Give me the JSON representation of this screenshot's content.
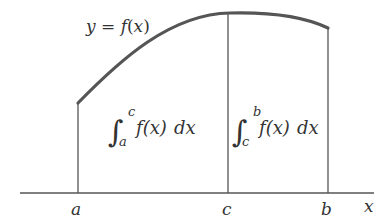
{
  "diagram": {
    "curve_label": "y = f(x)",
    "curve_label_parts": {
      "y": "y",
      "eq": " = ",
      "f": "f",
      "paren_open": "(",
      "x": "x",
      "paren_close": ")"
    },
    "axis_label": "x",
    "ticks": [
      {
        "label": "a",
        "x": 78
      },
      {
        "label": "c",
        "x": 228
      },
      {
        "label": "b",
        "x": 328
      }
    ],
    "integrals": [
      {
        "lower": "a",
        "upper": "c",
        "integrand": "f(x)",
        "differential": "dx"
      },
      {
        "lower": "c",
        "upper": "b",
        "integrand": "f(x)",
        "differential": "dx"
      }
    ],
    "colors": {
      "curve": "#555555",
      "lines": "#555555",
      "text": "#333333",
      "background": "#ffffff"
    }
  }
}
